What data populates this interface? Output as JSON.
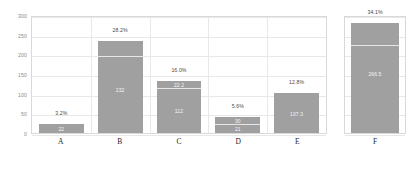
{
  "chart_data": {
    "type": "bar",
    "title": "",
    "xlabel": "",
    "ylabel": "",
    "ylim": [
      0,
      300
    ],
    "yticks": [
      0,
      50,
      100,
      150,
      200,
      250,
      300
    ],
    "grid": true,
    "legend": null,
    "categories": [
      "A",
      "B",
      "C",
      "D",
      "E",
      "F"
    ],
    "values": [
      22,
      235,
      132,
      40,
      101,
      279
    ],
    "percent_labels": [
      "3.2%",
      "28.2%",
      "16.0%",
      "5.6%",
      "12.8%",
      "34.1%"
    ],
    "bar_color": "#a0a0a0",
    "bars": [
      {
        "category": "A",
        "total": 22,
        "percent_label": "3.2%",
        "divider": null,
        "inner_labels": [
          {
            "text": "22",
            "value": 11
          }
        ]
      },
      {
        "category": "B",
        "total": 235,
        "percent_label": "28.2%",
        "divider": 192,
        "inner_labels": [
          {
            "text": "232",
            "value": 110
          }
        ]
      },
      {
        "category": "C",
        "total": 132,
        "percent_label": "16.0%",
        "divider": 112,
        "inner_labels": [
          {
            "text": "22.2",
            "value": 122
          },
          {
            "text": "112",
            "value": 57
          }
        ]
      },
      {
        "category": "D",
        "total": 40,
        "percent_label": "5.6%",
        "divider": 21,
        "inner_labels": [
          {
            "text": "30",
            "value": 30
          },
          {
            "text": "21",
            "value": 10
          }
        ]
      },
      {
        "category": "E",
        "total": 101,
        "percent_label": "12.8%",
        "divider": null,
        "inner_labels": [
          {
            "text": "107.3",
            "value": 48
          }
        ]
      },
      {
        "category": "F",
        "total": 279,
        "percent_label": "34.1%",
        "divider": 222,
        "inner_labels": [
          {
            "text": "266.5",
            "value": 150
          }
        ]
      }
    ],
    "panels": [
      {
        "name": "main",
        "categories": [
          "A",
          "B",
          "C",
          "D",
          "E"
        ]
      },
      {
        "name": "extra",
        "categories": [
          "F"
        ]
      }
    ]
  }
}
